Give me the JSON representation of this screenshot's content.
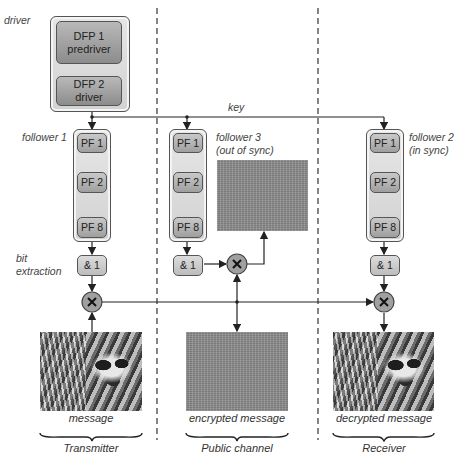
{
  "diagram": {
    "type": "chaotic-synchronization-encryption-scheme",
    "driver": {
      "label": "driver",
      "blocks": [
        {
          "line1": "DFP 1",
          "line2": "predriver"
        },
        {
          "line1": "DFP 2",
          "line2": "driver"
        }
      ]
    },
    "key_label": "key",
    "followers": [
      {
        "label": "follower 1",
        "sublabel": "",
        "blocks": [
          "PF 1",
          "PF 2",
          "PF 8"
        ],
        "extraction": "& 1"
      },
      {
        "label": "follower 3",
        "sublabel": "(out of sync)",
        "blocks": [
          "PF 1",
          "PF 2",
          "PF 8"
        ],
        "extraction": "& 1"
      },
      {
        "label": "follower 2",
        "sublabel": "(in sync)",
        "blocks": [
          "PF 1",
          "PF 2",
          "PF 8"
        ],
        "extraction": "& 1"
      }
    ],
    "bit_extraction_label": {
      "line1": "bit",
      "line2": "extraction"
    },
    "operator_symbol": "×",
    "images": [
      {
        "caption": "message",
        "kind": "raccoon-photo"
      },
      {
        "caption": "encrypted message",
        "kind": "noise"
      },
      {
        "caption": "decrypted message",
        "kind": "raccoon-photo"
      }
    ],
    "sections": [
      "Transmitter",
      "Public channel",
      "Receiver"
    ],
    "colors": {
      "line": "#222222",
      "block": "#a8a8a8",
      "outer": "#dcdcdc",
      "noise": "#8e8e8e"
    }
  }
}
